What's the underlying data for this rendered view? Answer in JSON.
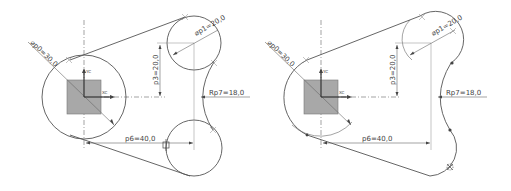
{
  "figures": [
    {
      "id": "left",
      "labels": {
        "diameter_p0": "⌀p0=30,0",
        "diameter_p1": "⌀p1=20,0",
        "dist_p3": "p3=20,0",
        "dist_p6": "p6=40,0",
        "radius_p7": "Rp7=18,0",
        "axis_y": "YC",
        "axis_x": "XC"
      }
    },
    {
      "id": "right",
      "labels": {
        "diameter_p0": "⌀p0=30,0",
        "diameter_p1": "⌀p1=20,0",
        "dist_p3": "p3=20,0",
        "dist_p6": "p6=40,0",
        "radius_p7": "Rp7=18,0",
        "axis_y": "YC",
        "axis_x": "XC"
      }
    }
  ],
  "colors": {
    "geometry": "#555555",
    "dimension": "#666666",
    "square_fill": "#a8a8a8",
    "background": "#ffffff"
  }
}
